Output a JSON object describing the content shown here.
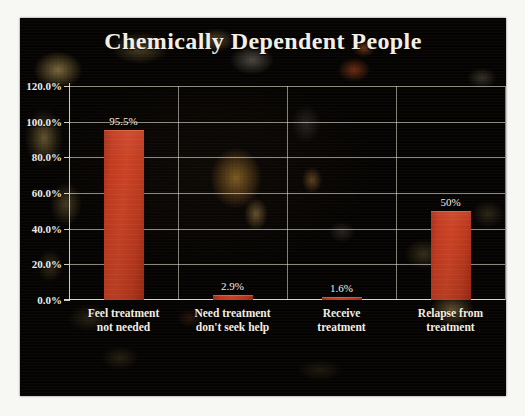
{
  "slide": {
    "title": "Chemically Dependent People",
    "background_color": "#070504",
    "border_color": "#f7f7f4",
    "bar_color": "#c33c21",
    "text_color": "#f3ede2",
    "grid_color": "#ece8dc"
  },
  "chart_data": {
    "type": "bar",
    "title": "Chemically Dependent People",
    "xlabel": "",
    "ylabel": "",
    "ylim": [
      0,
      120
    ],
    "grid": true,
    "legend": "none",
    "categories": [
      "Feel treatment not needed",
      "Need treatment don't seek help",
      "Receive treatment",
      "Relapse from treatment"
    ],
    "category_lines": [
      [
        "Feel treatment",
        "not needed"
      ],
      [
        "Need treatment",
        "don't seek help"
      ],
      [
        "Receive",
        "treatment"
      ],
      [
        "Relapse from",
        "treatment"
      ]
    ],
    "values": [
      95.5,
      2.9,
      1.6,
      50
    ],
    "data_labels": [
      "95.5%",
      "2.9%",
      "1.6%",
      "50%"
    ],
    "ytick_values": [
      0,
      20,
      40,
      60,
      80,
      100,
      120
    ],
    "ytick_labels": [
      "0.0%",
      "20.0%",
      "40.0%",
      "60.0%",
      "80.0%",
      "100.0%",
      "120.0%"
    ]
  }
}
